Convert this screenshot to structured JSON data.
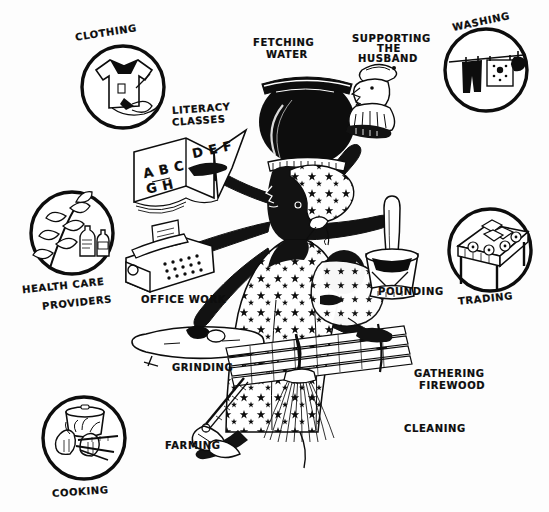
{
  "illustration": {
    "title": "Multiple Roles of Women",
    "style": "black-and-white hand-drawn line illustration",
    "background_color": "#fdfdfd",
    "ink_color": "#0d0d0d",
    "width": 549,
    "height": 512
  },
  "central_figure": {
    "name": "multi-armed woman",
    "description": "Woman with many arms carrying a water pot on her head and a baby on her back",
    "head_load": "water pot",
    "headwrap_pattern": "star print",
    "dress_pattern": "star print",
    "baby_on_back": "baby"
  },
  "circle_icons": [
    {
      "id": "clothing",
      "label": "CLOTHING",
      "icon": "shirt-with-needle-icon",
      "position": "top-left"
    },
    {
      "id": "washing",
      "label": "WASHING",
      "icon": "clothesline-icon",
      "position": "top-right"
    },
    {
      "id": "health",
      "label": "HEALTH CARE\nPROVIDERS",
      "icon": "medicinal-plant-bottles-icon",
      "position": "left"
    },
    {
      "id": "trading",
      "label": "TRADING",
      "icon": "market-stall-icon",
      "position": "right"
    },
    {
      "id": "cooking",
      "label": "COOKING",
      "icon": "cooking-pot-fire-icon",
      "position": "bottom-left"
    }
  ],
  "arm_tasks": [
    {
      "id": "fetching-water",
      "label": "FETCHING\nWATER",
      "icon": "water-pot-icon"
    },
    {
      "id": "supporting-husband",
      "label": "SUPPORTING\nTHE\nHUSBAND",
      "icon": "husband-figure-icon"
    },
    {
      "id": "literacy-classes",
      "label": "LITERACY\nCLASSES",
      "icon": "open-book-icon"
    },
    {
      "id": "office-work",
      "label": "OFFICE WORK",
      "icon": "typewriter-icon"
    },
    {
      "id": "grinding",
      "label": "GRINDING",
      "icon": "grinding-stone-icon"
    },
    {
      "id": "pounding",
      "label": "POUNDING",
      "icon": "mortar-pestle-icon"
    },
    {
      "id": "farming",
      "label": "FARMING",
      "icon": "hoe-icon"
    },
    {
      "id": "gathering-firewood",
      "label": "GATHERING\nFIREWOOD",
      "icon": "firewood-bundle-icon"
    },
    {
      "id": "cleaning",
      "label": "CLEANING",
      "icon": "broom-icon"
    }
  ],
  "book_text": {
    "left_page_line1": "A B C",
    "left_page_line2": "G H",
    "right_page_line1": "D E F"
  },
  "labels": {
    "clothing": "CLOTHING",
    "washing": "WASHING",
    "health_line1": "HEALTH CARE",
    "health_line2": "PROVIDERS",
    "trading": "TRADING",
    "cooking": "COOKING",
    "fetching_line1": "FETCHING",
    "fetching_line2": "WATER",
    "husband_line1": "SUPPORTING",
    "husband_line2": "THE",
    "husband_line3": "HUSBAND",
    "literacy_line1": "LITERACY",
    "literacy_line2": "CLASSES",
    "office_work": "OFFICE WORK",
    "grinding": "GRINDING",
    "pounding": "POUNDING",
    "farming": "FARMING",
    "firewood_line1": "GATHERING",
    "firewood_line2": "FIREWOOD",
    "cleaning": "CLEANING"
  }
}
